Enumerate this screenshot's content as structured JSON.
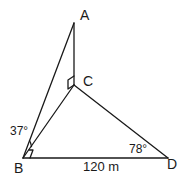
{
  "diagram": {
    "type": "geometry-figure",
    "points": {
      "A": {
        "label": "A"
      },
      "B": {
        "label": "B"
      },
      "C": {
        "label": "C"
      },
      "D": {
        "label": "D"
      }
    },
    "segments": [
      "AB",
      "AC",
      "BC",
      "CD",
      "BD"
    ],
    "right_angles": [
      "ACB",
      "CBD"
    ],
    "angles": {
      "ABC": "37°",
      "BDC": "78°"
    },
    "lengths": {
      "BD": "120 m"
    },
    "colors": {
      "stroke": "#1a1a1a",
      "background": "#ffffff"
    }
  }
}
